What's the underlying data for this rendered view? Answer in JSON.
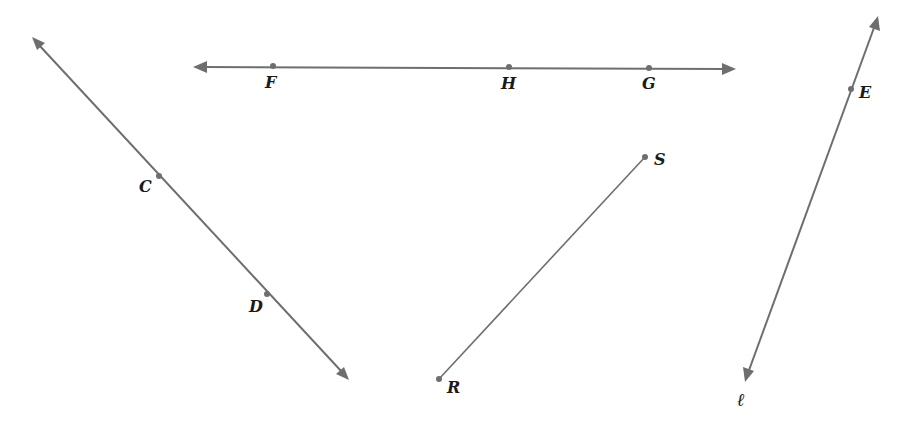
{
  "diagram": {
    "colors": {
      "line": "#6e6e6e",
      "label": "#1a1a1a",
      "background": "#ffffff"
    },
    "figures": [
      {
        "type": "line",
        "name": "line-FG",
        "from": [
          193,
          67
        ],
        "to": [
          736,
          69
        ],
        "points": [
          {
            "label": "F",
            "x": 273,
            "y": 66,
            "lx": 265,
            "ly": 88
          },
          {
            "label": "H",
            "x": 509,
            "y": 67,
            "lx": 501,
            "ly": 89
          },
          {
            "label": "G",
            "x": 649,
            "y": 68,
            "lx": 642,
            "ly": 89
          }
        ]
      },
      {
        "type": "line",
        "name": "line-CD",
        "from": [
          32,
          37
        ],
        "to": [
          349,
          380
        ],
        "points": [
          {
            "label": "C",
            "x": 159,
            "y": 176,
            "lx": 139,
            "ly": 192
          },
          {
            "label": "D",
            "x": 267,
            "y": 294,
            "lx": 249,
            "ly": 312
          }
        ]
      },
      {
        "type": "segment",
        "name": "segment-RS",
        "from": [
          439,
          379
        ],
        "to": [
          645,
          157
        ],
        "points": [
          {
            "label": "R",
            "x": 439,
            "y": 379,
            "lx": 447,
            "ly": 393
          },
          {
            "label": "S",
            "x": 645,
            "y": 157,
            "lx": 654,
            "ly": 165
          }
        ]
      },
      {
        "type": "line",
        "name": "line-l",
        "from": [
          878,
          16
        ],
        "to": [
          745,
          382
        ],
        "points": [
          {
            "label": "E",
            "x": 851,
            "y": 89,
            "lx": 859,
            "ly": 98
          }
        ],
        "line_label": {
          "label": "ℓ",
          "lx": 737,
          "ly": 406
        }
      }
    ]
  }
}
